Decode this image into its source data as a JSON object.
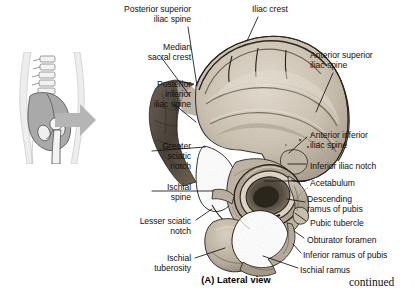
{
  "figure": {
    "caption": "(A)  Lateral view",
    "continued_note": "continued",
    "background_color": "#ffffff",
    "bone_color": "#cfc6b8",
    "arrow_color": "#b3b3b3",
    "leader_color": "#141414",
    "inset": {
      "name": "orientation-inset",
      "description": "whole-body outline with vertebral column, pelvis and femur"
    },
    "main_specimen": {
      "name": "hip-bone-lateral-photo",
      "description": "photograph of right hip bone seen from the lateral side"
    },
    "labels": [
      {
        "id": "posterior-superior-iliac-spine",
        "text": "Posterior superior\niliac spine",
        "align": "right",
        "x": 81,
        "y": 4,
        "w": 110,
        "leader": [
          [
            188,
            27
          ],
          [
            197,
            86
          ]
        ]
      },
      {
        "id": "iliac-crest",
        "text": "Iliac crest",
        "align": "left",
        "x": 252,
        "y": 4,
        "w": 70,
        "leader": [
          [
            258,
            17
          ],
          [
            247,
            41
          ]
        ]
      },
      {
        "id": "median-sacral-crest",
        "text": "Median\nsacral crest",
        "align": "right",
        "x": 83,
        "y": 42,
        "w": 108,
        "leader": [
          [
            161,
            57
          ],
          [
            190,
            96
          ]
        ]
      },
      {
        "id": "anterior-superior-iliac-spine",
        "text": "Anterior superior\niliac spine",
        "align": "left",
        "x": 310,
        "y": 50,
        "w": 105,
        "leader": [
          [
            333,
            73
          ],
          [
            316,
            112
          ]
        ]
      },
      {
        "id": "posterior-inferior-iliac-spine",
        "text": "Posterior\ninferior\niliac spine",
        "align": "right",
        "x": 83,
        "y": 79,
        "w": 108,
        "leader": [
          [
            175,
            105
          ],
          [
            196,
            122
          ]
        ]
      },
      {
        "id": "greater-sciatic-notch",
        "text": "Greater\nsciatic\nnotch",
        "align": "right",
        "x": 83,
        "y": 141,
        "w": 108,
        "leader": [
          [
            152,
            151
          ],
          [
            205,
            147
          ]
        ]
      },
      {
        "id": "anterior-inferior-iliac-spine",
        "text": "Anterior inferior\niliac spine",
        "align": "left",
        "x": 310,
        "y": 130,
        "w": 105,
        "leader": [
          [
            307,
            137
          ],
          [
            289,
            153
          ]
        ]
      },
      {
        "id": "inferior-iliac-notch",
        "text": "Inferior iliac notch",
        "align": "left",
        "x": 310,
        "y": 161,
        "w": 105,
        "leader": [
          [
            306,
            164
          ],
          [
            288,
            164
          ]
        ]
      },
      {
        "id": "acetabulum",
        "text": "Acetabulum",
        "align": "left",
        "x": 310,
        "y": 178,
        "w": 105,
        "leader": [
          [
            306,
            181
          ],
          [
            264,
            181
          ]
        ]
      },
      {
        "id": "ischial-spine",
        "text": "Ischial\nspine",
        "align": "right",
        "x": 83,
        "y": 182,
        "w": 108,
        "leader": [
          [
            152,
            191
          ],
          [
            213,
            191
          ]
        ]
      },
      {
        "id": "descending-ramus-of-pubis",
        "text": "Descending\nramus of pubis",
        "align": "left",
        "x": 307,
        "y": 194,
        "w": 108,
        "leader": [
          [
            305,
            202
          ],
          [
            287,
            199
          ]
        ]
      },
      {
        "id": "lesser-sciatic-notch",
        "text": "Lesser sciatic\nnotch",
        "align": "right",
        "x": 70,
        "y": 216,
        "w": 121,
        "leader": [
          [
            196,
            220
          ],
          [
            212,
            209
          ]
        ]
      },
      {
        "id": "pubic-tubercle",
        "text": "Pubic tubercle",
        "align": "left",
        "x": 310,
        "y": 218,
        "w": 105,
        "leader": [
          [
            306,
            221
          ],
          [
            295,
            213
          ]
        ]
      },
      {
        "id": "obturator-foramen",
        "text": "Obturator foramen",
        "align": "left",
        "x": 307,
        "y": 235,
        "w": 108,
        "leader": [
          [
            304,
            238
          ],
          [
            294,
            231
          ]
        ]
      },
      {
        "id": "inferior-ramus-of-pubis",
        "text": "Inferior ramus of pubis",
        "align": "left",
        "x": 303,
        "y": 250,
        "w": 112,
        "leader": [
          [
            301,
            253
          ],
          [
            293,
            244
          ]
        ]
      },
      {
        "id": "ischial-tuberosity",
        "text": "Ischial\ntuberosity",
        "align": "right",
        "x": 83,
        "y": 253,
        "w": 108,
        "leader": [
          [
            195,
            258
          ],
          [
            225,
            248
          ]
        ]
      },
      {
        "id": "ischial-ramus",
        "text": "Ischial ramus",
        "align": "left",
        "x": 300,
        "y": 265,
        "w": 112,
        "leader": [
          [
            298,
            268
          ],
          [
            263,
            256
          ]
        ]
      }
    ]
  }
}
